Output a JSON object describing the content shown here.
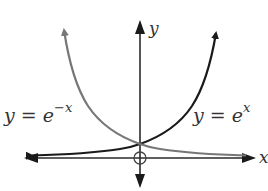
{
  "figure": {
    "axis_labels": {
      "x": "x",
      "y": "y"
    },
    "curves": [
      {
        "name": "exp-positive",
        "label_base": "y = e",
        "label_exp": "x",
        "color": "#1a1a1a"
      },
      {
        "name": "exp-negative",
        "label_base": "y = e",
        "label_exp": "−x",
        "color": "#777777"
      }
    ],
    "origin_marker": "open-circle",
    "colors": {
      "axis": "#2a2a2a",
      "curve_pos": "#1a1a1a",
      "curve_neg": "#777777",
      "text": "#333333"
    }
  }
}
